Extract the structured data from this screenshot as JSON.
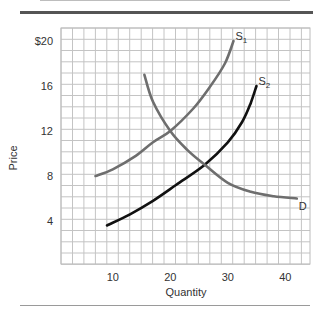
{
  "chart_data": {
    "type": "line",
    "title": "",
    "xlabel": "Quantity",
    "ylabel": "Price",
    "xlim": [
      1,
      44
    ],
    "ylim": [
      0,
      21
    ],
    "x_ticks": [
      10,
      20,
      30,
      40
    ],
    "x_tick_labels": [
      "10",
      "20",
      "30",
      "40"
    ],
    "y_ticks": [
      4,
      8,
      12,
      16,
      20
    ],
    "y_tick_labels": [
      "4",
      "8",
      "12",
      "16",
      "$20"
    ],
    "grid": true,
    "legend": "none (curves labeled inline)",
    "series": [
      {
        "name": "S1",
        "label_main": "S",
        "label_sub": "1",
        "color": "#6e6e6e",
        "points": [
          [
            7,
            8
          ],
          [
            10,
            8.6
          ],
          [
            14,
            9.8
          ],
          [
            17,
            11
          ],
          [
            20,
            12
          ],
          [
            24,
            14
          ],
          [
            27,
            16
          ],
          [
            29.5,
            18
          ],
          [
            31,
            20
          ]
        ]
      },
      {
        "name": "S2",
        "label_main": "S",
        "label_sub": "2",
        "color": "#111111",
        "points": [
          [
            9,
            3.6
          ],
          [
            13,
            4.6
          ],
          [
            17,
            5.8
          ],
          [
            21,
            7.2
          ],
          [
            26,
            9
          ],
          [
            30,
            11
          ],
          [
            32.5,
            12.8
          ],
          [
            34,
            14.5
          ],
          [
            35,
            16
          ]
        ]
      },
      {
        "name": "D",
        "label_main": "D",
        "label_sub": "",
        "color": "#6e6e6e",
        "points": [
          [
            15.5,
            17
          ],
          [
            17,
            14.6
          ],
          [
            20,
            12
          ],
          [
            23,
            10.3
          ],
          [
            26,
            9
          ],
          [
            30,
            7.4
          ],
          [
            34,
            6.6
          ],
          [
            38,
            6.2
          ],
          [
            42,
            6
          ]
        ]
      }
    ],
    "intersections": [
      {
        "curves": [
          "S1",
          "D"
        ],
        "quantity": 20,
        "price": 12
      },
      {
        "curves": [
          "S2",
          "D"
        ],
        "quantity": 26,
        "price": 9
      }
    ]
  }
}
